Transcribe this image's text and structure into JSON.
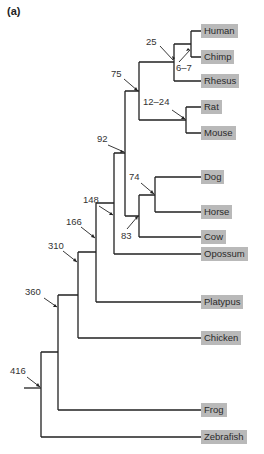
{
  "panel_label": "(a)",
  "diagram": {
    "type": "phylogenetic-tree",
    "label_color": "#b9b9b9",
    "line_color": "#222222",
    "taxa": [
      {
        "name": "Human",
        "y": 31
      },
      {
        "name": "Chimp",
        "y": 57
      },
      {
        "name": "Rhesus",
        "y": 81
      },
      {
        "name": "Rat",
        "y": 107
      },
      {
        "name": "Mouse",
        "y": 133
      },
      {
        "name": "Dog",
        "y": 177
      },
      {
        "name": "Horse",
        "y": 212
      },
      {
        "name": "Cow",
        "y": 237
      },
      {
        "name": "Opossum",
        "y": 254
      },
      {
        "name": "Platypus",
        "y": 302
      },
      {
        "name": "Chicken",
        "y": 338
      },
      {
        "name": "Frog",
        "y": 410
      },
      {
        "name": "Zebrafish",
        "y": 437
      }
    ],
    "divergence_times": [
      {
        "label": "25",
        "x": 148,
        "y": 38
      },
      {
        "label": "6–7",
        "x": 177,
        "y": 66
      },
      {
        "label": "75",
        "x": 112,
        "y": 69
      },
      {
        "label": "12–24",
        "x": 143,
        "y": 99
      },
      {
        "label": "92",
        "x": 98,
        "y": 136
      },
      {
        "label": "74",
        "x": 129,
        "y": 173
      },
      {
        "label": "83",
        "x": 121,
        "y": 232
      },
      {
        "label": "148",
        "x": 83,
        "y": 196
      },
      {
        "label": "166",
        "x": 67,
        "y": 217
      },
      {
        "label": "310",
        "x": 49,
        "y": 241
      },
      {
        "label": "360",
        "x": 25,
        "y": 288
      },
      {
        "label": "416",
        "x": 10,
        "y": 367
      }
    ]
  }
}
